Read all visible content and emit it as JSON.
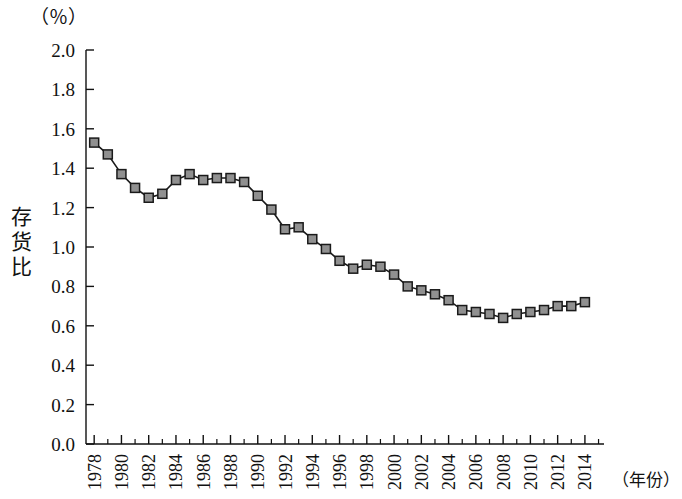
{
  "labels": {
    "unit": "（％）",
    "y_title_chars": [
      "存",
      "货",
      "比"
    ],
    "y_title": "存货比",
    "x_title": "（年份）"
  },
  "chart_data": {
    "type": "line",
    "title": "",
    "subtitle": "",
    "xlabel": "（年份）",
    "ylabel": "存货比",
    "unit": "（％）",
    "grid": false,
    "legend": "none",
    "marker": "square",
    "marker_color": "#909090",
    "marker_edge_color": "#1a1a1a",
    "line_color": "#1a1a1a",
    "xlim": [
      1977.4,
      2015.4
    ],
    "ylim": [
      0.0,
      2.0
    ],
    "ytick_labels": [
      "0.0",
      "0.2",
      "0.4",
      "0.6",
      "0.8",
      "1.0",
      "1.2",
      "1.4",
      "1.6",
      "1.8",
      "2.0"
    ],
    "ytick_values": [
      0.0,
      0.2,
      0.4,
      0.6,
      0.8,
      1.0,
      1.2,
      1.4,
      1.6,
      1.8,
      2.0
    ],
    "xtick_labels": [
      "1978",
      "1980",
      "1982",
      "1984",
      "1986",
      "1988",
      "1990",
      "1992",
      "1994",
      "1996",
      "1998",
      "2000",
      "2002",
      "2004",
      "2006",
      "2008",
      "2010",
      "2012",
      "2014"
    ],
    "xtick_values": [
      1978,
      1980,
      1982,
      1984,
      1986,
      1988,
      1990,
      1992,
      1994,
      1996,
      1998,
      2000,
      2002,
      2004,
      2006,
      2008,
      2010,
      2012,
      2014
    ],
    "x": [
      1978,
      1979,
      1980,
      1981,
      1982,
      1983,
      1984,
      1985,
      1986,
      1987,
      1988,
      1989,
      1990,
      1991,
      1992,
      1993,
      1994,
      1995,
      1996,
      1997,
      1998,
      1999,
      2000,
      2001,
      2002,
      2003,
      2004,
      2005,
      2006,
      2007,
      2008,
      2009,
      2010,
      2011,
      2012,
      2013,
      2014
    ],
    "values": [
      1.53,
      1.47,
      1.37,
      1.3,
      1.25,
      1.27,
      1.34,
      1.37,
      1.34,
      1.35,
      1.35,
      1.33,
      1.26,
      1.19,
      1.09,
      1.1,
      1.04,
      0.99,
      0.93,
      0.89,
      0.91,
      0.9,
      0.86,
      0.8,
      0.78,
      0.76,
      0.73,
      0.68,
      0.67,
      0.66,
      0.64,
      0.66,
      0.67,
      0.68,
      0.7,
      0.7,
      0.72
    ]
  }
}
